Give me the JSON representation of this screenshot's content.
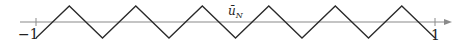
{
  "diagram": {
    "type": "triangle-wave-on-axis",
    "curve_label": "ū",
    "curve_label_subscript": "N",
    "axis": {
      "min_label": "−1",
      "max_label": "1",
      "domain": [
        -1,
        1
      ]
    },
    "wave": {
      "periods": 6,
      "start_phase": "trough",
      "amplitude": 1
    },
    "colors": {
      "axis": "#8a8a8a",
      "wave": "#2a2a2a",
      "text": "#222222"
    }
  }
}
